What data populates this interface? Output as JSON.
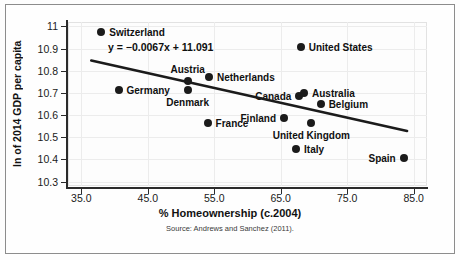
{
  "chart_data": {
    "type": "scatter",
    "title": "",
    "xlabel": "% Homeownership (c.2004)",
    "ylabel": "ln of 2014 GDP per capita",
    "source": "Source: Andrews and Sanchez (2011).",
    "xlim": [
      33.0,
      87.0
    ],
    "ylim": [
      10.28,
      11.02
    ],
    "xticks": [
      "35.0",
      "45.0",
      "55.0",
      "65.0",
      "75.0",
      "85.0"
    ],
    "xtick_values": [
      35.0,
      45.0,
      55.0,
      65.0,
      75.0,
      85.0
    ],
    "yticks": [
      "10.3",
      "10.4",
      "10.5",
      "10.6",
      "10.7",
      "10.8",
      "10.9",
      "11"
    ],
    "ytick_values": [
      10.3,
      10.4,
      10.5,
      10.6,
      10.7,
      10.8,
      10.9,
      11.0
    ],
    "grid": true,
    "legend": "none",
    "trendline": {
      "equation": "y = −0.0067x + 11.091",
      "slope": -0.0067,
      "intercept": 11.091,
      "x_start": 36.5,
      "x_end": 84.0
    },
    "points": [
      {
        "name": "Switzerland",
        "x": 38.0,
        "y": 10.975,
        "label_pos": "right"
      },
      {
        "name": "Germany",
        "x": 40.6,
        "y": 10.712,
        "label_pos": "right"
      },
      {
        "name": "Austria",
        "x": 51.0,
        "y": 10.755,
        "label_pos": "above"
      },
      {
        "name": "Denmark",
        "x": 51.0,
        "y": 10.715,
        "label_pos": "below"
      },
      {
        "name": "Netherlands",
        "x": 54.2,
        "y": 10.773,
        "label_pos": "right"
      },
      {
        "name": "France",
        "x": 54.0,
        "y": 10.563,
        "label_pos": "right"
      },
      {
        "name": "United States",
        "x": 68.0,
        "y": 10.905,
        "label_pos": "right"
      },
      {
        "name": "Canada",
        "x": 67.8,
        "y": 10.688,
        "label_pos": "left"
      },
      {
        "name": "Australia",
        "x": 68.5,
        "y": 10.7,
        "label_pos": "right"
      },
      {
        "name": "Belgium",
        "x": 71.0,
        "y": 10.652,
        "label_pos": "right"
      },
      {
        "name": "Finland",
        "x": 65.5,
        "y": 10.588,
        "label_pos": "left"
      },
      {
        "name": "United Kingdom",
        "x": 69.6,
        "y": 10.566,
        "label_pos": "below"
      },
      {
        "name": "Italy",
        "x": 67.3,
        "y": 10.447,
        "label_pos": "right"
      },
      {
        "name": "Spain",
        "x": 83.5,
        "y": 10.408,
        "label_pos": "left"
      }
    ]
  }
}
